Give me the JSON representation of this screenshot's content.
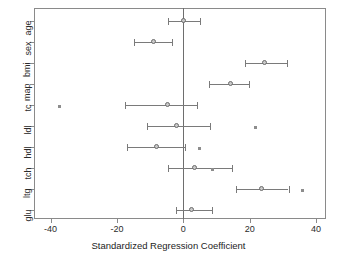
{
  "chart_data": {
    "type": "scatter",
    "title": "",
    "xlabel": "Standardized Regression Coefficient",
    "ylabel": "",
    "xlim": [
      -45,
      43
    ],
    "ylim": [
      0,
      11
    ],
    "xticks": [
      -40,
      -20,
      0,
      20,
      40
    ],
    "xticklabels": [
      "-40",
      "-20",
      "0",
      "20",
      "40"
    ],
    "categories": [
      "age",
      "sex",
      "bmi",
      "map",
      "tc",
      "ldl",
      "hdl",
      "tch",
      "ltg",
      "glu"
    ],
    "grid": false,
    "legend": null,
    "reference_line": 0,
    "orientation": "horizontal",
    "series": [
      {
        "name": "Standardized regression coefficient with confidence interval",
        "estimates": [
          0.3,
          -8.8,
          24.7,
          14.4,
          -4.6,
          -1.9,
          -7.8,
          3.6,
          23.6,
          2.7
        ],
        "ci_low": [
          -4.6,
          -15.0,
          18.6,
          7.6,
          -17.7,
          -11.0,
          -17.0,
          -4.6,
          15.8,
          -2.3
        ],
        "ci_high": [
          4.9,
          -3.3,
          31.3,
          19.9,
          4.1,
          8.0,
          0.6,
          14.7,
          31.7,
          8.5
        ]
      }
    ],
    "outliers": [
      {
        "category": "tc",
        "value": -37.5
      },
      {
        "category": "ldl",
        "value": 21.5
      },
      {
        "category": "hdl",
        "value": 4.6
      },
      {
        "category": "tch",
        "value": 8.6
      },
      {
        "category": "ltg",
        "value": 35.7
      }
    ],
    "colors": {
      "marker": "#c9c9c9",
      "marker_edge": "#6b6b6b",
      "error_bar": "#7a7a7a",
      "reference_line": "#6e6e6e",
      "axis": "#8a8a8a",
      "text": "#2b2b2b",
      "background": "#ffffff"
    }
  }
}
